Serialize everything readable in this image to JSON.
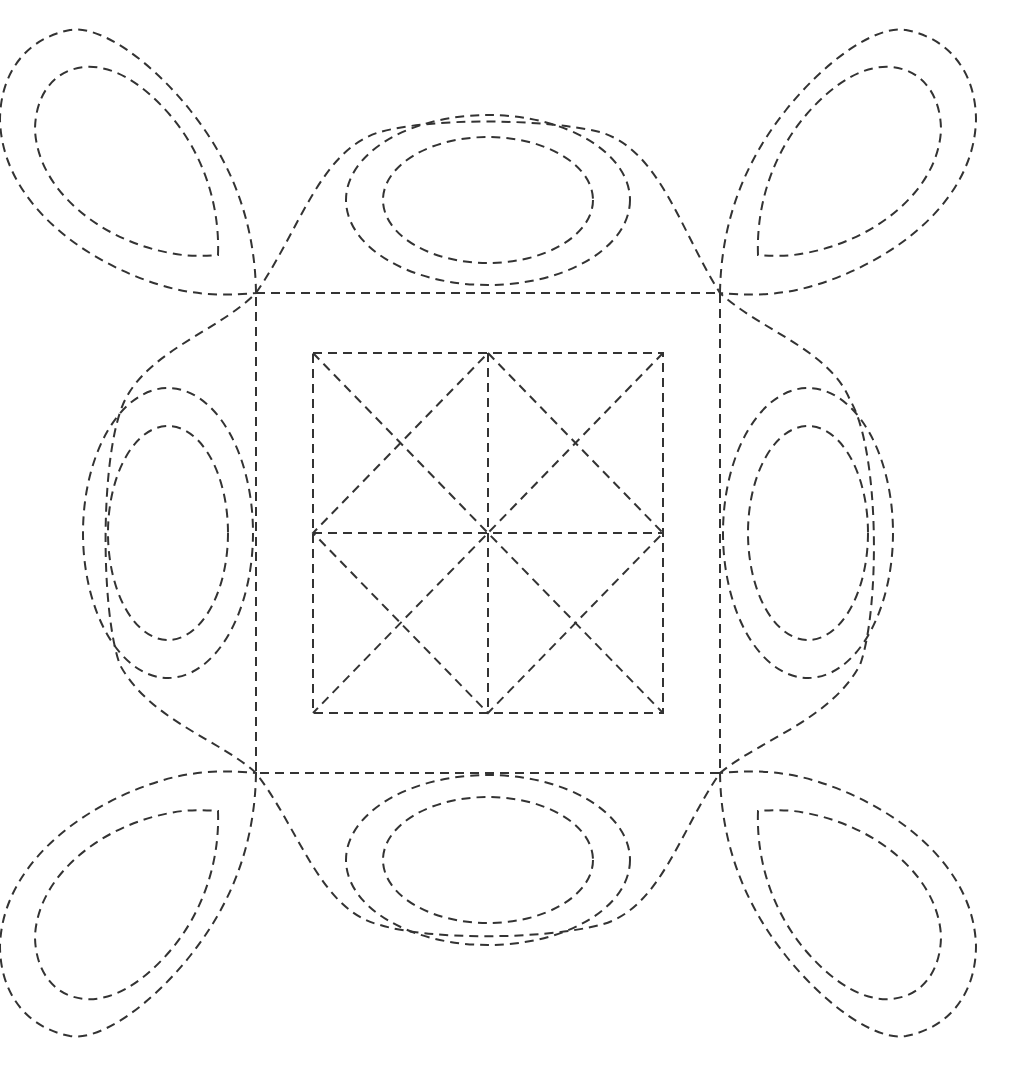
{
  "diagram": {
    "stroke_color": "#333333",
    "background_color": "#ffffff",
    "center": [
      488,
      533
    ],
    "outer_square": {
      "x1": 256,
      "y1": 293,
      "x2": 720,
      "y2": 773
    },
    "inner_square": {
      "x1": 313,
      "y1": 353,
      "x2": 663,
      "y2": 713
    },
    "elements": [
      "outer-square",
      "inner-square-with-star",
      "central-cushion-outline",
      "top-oval-pair",
      "bottom-oval-pair",
      "left-oval-pair",
      "right-oval-pair",
      "top-left-petal-pair",
      "top-right-petal-pair",
      "bottom-left-petal-pair",
      "bottom-right-petal-pair"
    ]
  }
}
